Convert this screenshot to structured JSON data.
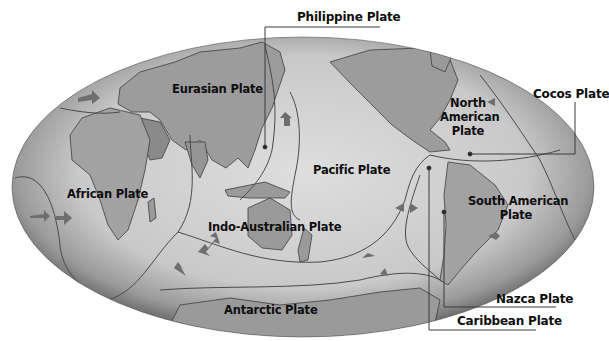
{
  "diagram": {
    "type": "world-map-tectonic-plates",
    "projection": "elliptical",
    "colors": {
      "ocean_light": "#d4d4d4",
      "ocean_edge": "#7a7a7a",
      "land": "#9a9a9a",
      "boundary": "#4a4a4a",
      "arrow": "#6e6e6e",
      "label": "#0d0d0d",
      "leader": "#3a3a3a"
    },
    "labels": {
      "philippine": "Philippine Plate",
      "eurasian": "Eurasian Plate",
      "north_american_1": "North",
      "north_american_2": "American",
      "north_american_3": "Plate",
      "cocos": "Cocos Plate",
      "pacific": "Pacific Plate",
      "african": "African Plate",
      "indo_australian": "Indo-Australian Plate",
      "south_american_1": "South American",
      "south_american_2": "Plate",
      "nazca": "Nazca Plate",
      "caribbean": "Caribbean Plate",
      "antarctic": "Antarctic Plate"
    }
  }
}
